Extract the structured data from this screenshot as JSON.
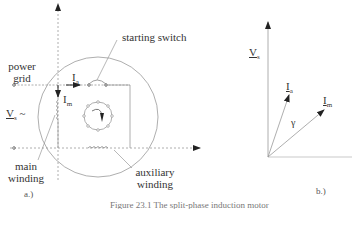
{
  "figure": {
    "caption": "Figure 23.1 The split-phase induction motor",
    "panel_a": {
      "label": "a.)",
      "labels": {
        "power_grid_line1": "power",
        "power_grid_line2": "grid",
        "starting_switch": "starting switch",
        "vs_symbol": "V",
        "vs_sub": "s",
        "vs_tilde": "~",
        "ia_symbol": "I",
        "ia_sub": "a",
        "im_symbol": "I",
        "im_sub": "m",
        "main_winding_line1": "main",
        "main_winding_line2": "winding",
        "aux_winding_line1": "auxiliary",
        "aux_winding_line2": "winding"
      }
    },
    "panel_b": {
      "label": "b.)",
      "phasors": [
        {
          "name": "V",
          "sub": "s",
          "direction": "vertical"
        },
        {
          "name": "I",
          "sub": "a",
          "direction": "leading"
        },
        {
          "name": "I",
          "sub": "m",
          "direction": "lagging"
        }
      ],
      "angle_label": "γ"
    },
    "colors": {
      "line": "#888888",
      "arrow": "#222222",
      "text": "#333333"
    }
  }
}
